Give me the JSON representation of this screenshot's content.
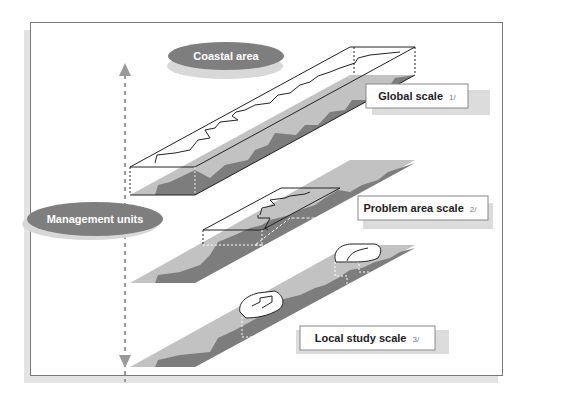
{
  "diagram": {
    "vertical_axis": {
      "top_label": "Coastal area",
      "middle_label": "Management units",
      "direction": "bidirectional"
    },
    "layers": [
      {
        "id": "global",
        "label": "Global scale",
        "footnote": "1/"
      },
      {
        "id": "problem_area",
        "label": "Problem area scale",
        "footnote": "2/"
      },
      {
        "id": "local_study",
        "label": "Local study scale",
        "footnote": "3/"
      }
    ],
    "colors": {
      "land_light": "#c2c2c2",
      "land_dark": "#7d7d7d",
      "ellipse_fill": "#7e7e7e",
      "ellipse_shadow": "#d8d8d8",
      "arrow": "#9a9a9a",
      "frame_border": "#7a7a7a",
      "frame_shadow": "#e3e3e3"
    }
  }
}
